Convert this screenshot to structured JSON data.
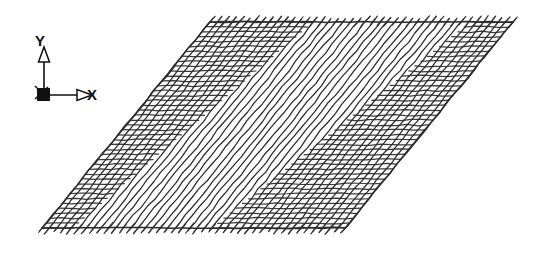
{
  "figure": {
    "kind": "finite-element-mesh",
    "background_color": "#ffffff",
    "line_color": "#2b2b2b",
    "line_color_light": "#3a3a3a"
  },
  "axis_triad": {
    "name": "coordinate-axis-triad",
    "origin": {
      "x": 44,
      "y": 95
    },
    "x_axis": {
      "label": "X",
      "label_x": 92,
      "label_y": 100,
      "tip_x": 79,
      "tip_y": 95,
      "arrow": "open-triangle"
    },
    "y_axis": {
      "label": "Y",
      "label_x": 40,
      "label_y": 46,
      "tip_x": 44,
      "tip_y": 60,
      "arrow": "open-triangle"
    },
    "z_axis": {
      "label": "Z",
      "label_x": 38,
      "label_y": 96,
      "arrow": "into-page-marker"
    }
  },
  "plate": {
    "name": "mesh-plate-outline",
    "corners": {
      "bottom_left": {
        "x": 42,
        "y": 228
      },
      "bottom_right": {
        "x": 345,
        "y": 228
      },
      "top_right": {
        "x": 513,
        "y": 22
      },
      "top_left": {
        "x": 210,
        "y": 22
      }
    },
    "edge_labels": {
      "top": "top-edge",
      "bottom": "bottom-edge",
      "left": "left-edge",
      "right": "right-edge"
    }
  },
  "mesh": {
    "name": "mesh-grid",
    "family_a": {
      "name": "diagonal-family-forward",
      "direction": "bottom-left-to-top-right",
      "count": 41,
      "stroke_width": 1.25
    },
    "family_b": {
      "name": "diagonal-family-backward",
      "direction": "top-left-to-bottom-right",
      "count": 42,
      "stroke_width": 1.25
    },
    "zones": [
      {
        "name": "dense-zone-left",
        "type": "crosshatch",
        "u_from": 0.0,
        "u_to": 0.34
      },
      {
        "name": "sparse-zone-center",
        "type": "parallel-only",
        "u_from": 0.34,
        "u_to": 0.56
      },
      {
        "name": "dense-zone-right",
        "type": "crosshatch",
        "u_from": 0.56,
        "u_to": 1.0
      }
    ],
    "tick_stubs": {
      "name": "edge-tick-stubs",
      "overshoot_px": 6,
      "edges": [
        "top",
        "bottom"
      ]
    }
  }
}
